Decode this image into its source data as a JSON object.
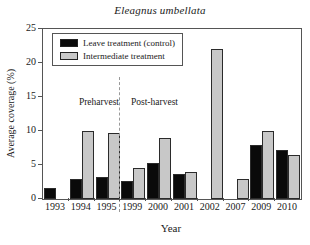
{
  "title": "Eleagnus umbellata",
  "colors": {
    "leave_series": "#0a0a0a",
    "intermediate_series": "#c8c8c8",
    "bar_border": "#2b2b2b",
    "axis": "#555555",
    "divider": "#999999",
    "background": "#ffffff"
  },
  "chart_data": {
    "type": "bar",
    "title": "Eleagnus umbellata",
    "xlabel": "Year",
    "ylabel": "Average coverage (%)",
    "ylim": [
      0,
      25
    ],
    "yticks": [
      0,
      5,
      10,
      15,
      20,
      25
    ],
    "grid": false,
    "legend_position": "top-left",
    "categories": [
      "1993",
      "1994",
      "1995",
      "1999",
      "2000",
      "2001",
      "2002",
      "2007",
      "2009",
      "2010"
    ],
    "series": [
      {
        "name": "Leave treatment (control)",
        "color": "#0a0a0a",
        "values": [
          1.6,
          3.0,
          3.2,
          2.7,
          5.3,
          3.7,
          null,
          null,
          8.0,
          7.2
        ]
      },
      {
        "name": "Intermediate treatment",
        "color": "#c8c8c8",
        "values": [
          null,
          10.0,
          9.7,
          4.5,
          9.0,
          4.0,
          22.0,
          3.0,
          10.0,
          6.5
        ]
      }
    ],
    "annotations": {
      "divider_after_category": "1995",
      "left_label": "Preharvest",
      "right_label": "Post-harvest"
    }
  }
}
